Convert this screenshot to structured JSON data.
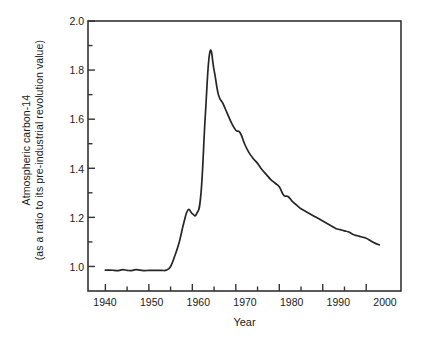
{
  "figure": {
    "background_color": "#ffffff",
    "line_color": "#262626",
    "axis_color": "#333333"
  },
  "chart_data": {
    "type": "line",
    "title": "",
    "xlabel": "Year",
    "ylabel": "Atmospheric carbon-14 (as a ratio to its pre-industrial revolution value)",
    "ylabel_line1": "Atmospheric carbon-14",
    "ylabel_line2": "(as a ratio to its pre-industrial revolution value)",
    "xlim": [
      1936,
      2008
    ],
    "ylim": [
      0.9,
      2.0
    ],
    "grid": false,
    "legend": "none",
    "xticks": [
      1940,
      1950,
      1960,
      1970,
      1980,
      1990,
      2000
    ],
    "xtick_labels": [
      "1940",
      "1950",
      "1960",
      "1970",
      "1980",
      "1990",
      "2000"
    ],
    "xminor_ticks": [
      1945,
      1955,
      1965,
      1975,
      1985,
      1995
    ],
    "yticks": [
      1.0,
      1.2,
      1.4,
      1.6,
      1.8,
      2.0
    ],
    "ytick_labels": [
      "1.0",
      "1.2",
      "1.4",
      "1.6",
      "1.8",
      "2.0"
    ],
    "yminor_ticks": [
      1.1,
      1.3,
      1.5,
      1.7,
      1.9
    ],
    "series": [
      {
        "name": "Atmospheric carbon-14 ratio",
        "x": [
          1940,
          1941,
          1942,
          1943,
          1944,
          1945,
          1946,
          1947,
          1948,
          1949,
          1950,
          1951,
          1952,
          1953,
          1954,
          1955,
          1956,
          1957,
          1958,
          1959,
          1960,
          1961,
          1962,
          1963,
          1964,
          1965,
          1966,
          1967,
          1968,
          1969,
          1970,
          1971,
          1972,
          1973,
          1974,
          1975,
          1976,
          1977,
          1978,
          1979,
          1980,
          1981,
          1982,
          1983,
          1984,
          1985,
          1986,
          1987,
          1988,
          1989,
          1990,
          1991,
          1992,
          1993,
          1994,
          1995,
          1996,
          1997,
          1998,
          1999,
          2000,
          2001,
          2002,
          2003
        ],
        "y": [
          0.985,
          0.985,
          0.984,
          0.983,
          0.987,
          0.984,
          0.983,
          0.987,
          0.985,
          0.983,
          0.984,
          0.984,
          0.984,
          0.984,
          0.985,
          1.0,
          1.045,
          1.1,
          1.175,
          1.23,
          1.215,
          1.215,
          1.3,
          1.62,
          1.87,
          1.8,
          1.7,
          1.665,
          1.625,
          1.585,
          1.555,
          1.545,
          1.5,
          1.465,
          1.44,
          1.42,
          1.395,
          1.375,
          1.355,
          1.34,
          1.325,
          1.29,
          1.285,
          1.265,
          1.25,
          1.235,
          1.225,
          1.215,
          1.205,
          1.195,
          1.185,
          1.175,
          1.165,
          1.155,
          1.15,
          1.145,
          1.14,
          1.13,
          1.125,
          1.12,
          1.115,
          1.105,
          1.095,
          1.088
        ]
      }
    ],
    "annotations": [],
    "peak": {
      "year": 1964,
      "value": 1.87
    },
    "baseline": {
      "years": "1940-1954",
      "value": 0.985
    }
  }
}
